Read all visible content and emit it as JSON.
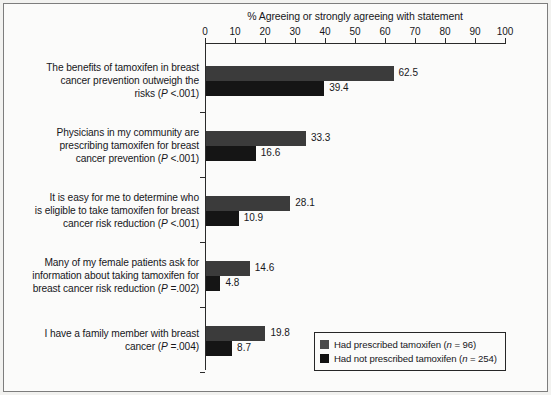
{
  "chart_data": {
    "type": "bar",
    "orientation": "horizontal",
    "title": "% Agreeing or strongly agreeing with statement",
    "xlabel": "",
    "ylabel": "",
    "xlim": [
      0,
      100
    ],
    "xticks": [
      0,
      10,
      20,
      30,
      40,
      50,
      60,
      70,
      80,
      90,
      100
    ],
    "grid": false,
    "legend_position": "bottom-right",
    "categories": [
      "The benefits of tamoxifen in breast cancer prevention outweigh the risks (P <.001)",
      "Physicians in my community are prescribing tamoxifen for breast cancer prevention (P <.001)",
      "It is easy for me to determine who is eligible to take tamoxifen for breast cancer risk reduction (P <.001)",
      "Many of my female patients ask for information about taking tamoxifen for breast cancer risk reduction (P =.002)",
      "I have a family member with breast cancer (P =.004)"
    ],
    "category_lines": [
      [
        "The benefits of tamoxifen in breast",
        "cancer prevention outweigh the",
        "risks (P <.001)"
      ],
      [
        "Physicians in my community are",
        "prescribing tamoxifen for breast",
        "cancer prevention (P <.001)"
      ],
      [
        "It is easy for me to determine who",
        "is eligible to take tamoxifen for breast",
        "cancer risk reduction (P <.001)"
      ],
      [
        "Many of my female patients ask for",
        "information about taking tamoxifen for",
        "breast cancer risk reduction (P =.002)"
      ],
      [
        "I have a family member with breast",
        "cancer (P =.004)"
      ]
    ],
    "series": [
      {
        "name": "Had prescribed tamoxifen (n = 96)",
        "color": "#3b3b3b",
        "values": [
          62.5,
          33.3,
          28.1,
          14.6,
          19.8
        ]
      },
      {
        "name": "Had not prescribed tamoxifen (n = 254)",
        "color": "#151515",
        "values": [
          39.4,
          16.6,
          10.9,
          4.8,
          8.7
        ]
      }
    ]
  },
  "legend": {
    "items": [
      {
        "label": "Had prescribed tamoxifen (n = 96)",
        "swatch": "legend-swatch-0"
      },
      {
        "label": "Had not prescribed tamoxifen (n = 254)",
        "swatch": "legend-swatch-1"
      }
    ]
  }
}
